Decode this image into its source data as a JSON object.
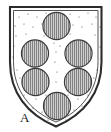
{
  "figure": {
    "name": "heraldic-shield-coat-of-arms",
    "label": "A",
    "label_position": "bottom-left",
    "background_color": "#ffffff"
  },
  "shield": {
    "outline_color": "#2b2b2b",
    "outer_stroke_width": 2.1,
    "inner_stroke_width": 0.9,
    "field_fill": "#ffffff",
    "field_texture": "stippled-dots",
    "field_dot_color": "#555555",
    "shape": "squared-top-pointed-base",
    "bounds": {
      "x": 9,
      "y": 6,
      "width": 94,
      "height": 120
    }
  },
  "charges": {
    "type": "roundel",
    "count": 6,
    "arrangement": "1-2-2-1",
    "hatching": "vertical-lines",
    "hatch_meaning": "gules",
    "fill_color": "#c9c9c9",
    "hatch_color": "#6e6e6e",
    "edge_color": "#3a3a3a",
    "items": [
      {
        "id": "roundel-1",
        "label": "1",
        "cx": 56.5,
        "cy": 26.0,
        "r": 13.6
      },
      {
        "id": "roundel-2",
        "label": "2",
        "cx": 35.0,
        "cy": 53.5,
        "r": 13.6
      },
      {
        "id": "roundel-3",
        "label": "3",
        "cx": 78.5,
        "cy": 53.5,
        "r": 13.6
      },
      {
        "id": "roundel-4",
        "label": "4",
        "cx": 35.5,
        "cy": 82.0,
        "r": 13.6
      },
      {
        "id": "roundel-5",
        "label": "5",
        "cx": 78.0,
        "cy": 82.0,
        "r": 13.6
      },
      {
        "id": "roundel-6",
        "label": "6",
        "cx": 57.0,
        "cy": 106.0,
        "r": 13.6
      }
    ]
  },
  "field_dots": [
    {
      "cx": 19,
      "cy": 17
    },
    {
      "cx": 28,
      "cy": 14
    },
    {
      "cx": 37,
      "cy": 17
    },
    {
      "cx": 46,
      "cy": 13
    },
    {
      "cx": 70,
      "cy": 14
    },
    {
      "cx": 79,
      "cy": 17
    },
    {
      "cx": 88,
      "cy": 13
    },
    {
      "cx": 96,
      "cy": 17
    },
    {
      "cx": 15,
      "cy": 26
    },
    {
      "cx": 24,
      "cy": 24
    },
    {
      "cx": 33,
      "cy": 27
    },
    {
      "cx": 42,
      "cy": 24
    },
    {
      "cx": 73,
      "cy": 25
    },
    {
      "cx": 82,
      "cy": 27
    },
    {
      "cx": 92,
      "cy": 24
    },
    {
      "cx": 100,
      "cy": 27
    },
    {
      "cx": 16,
      "cy": 36
    },
    {
      "cx": 26,
      "cy": 34
    },
    {
      "cx": 44,
      "cy": 36
    },
    {
      "cx": 54,
      "cy": 43
    },
    {
      "cx": 64,
      "cy": 36
    },
    {
      "cx": 70,
      "cy": 34
    },
    {
      "cx": 95,
      "cy": 35
    },
    {
      "cx": 102,
      "cy": 38
    },
    {
      "cx": 14,
      "cy": 46
    },
    {
      "cx": 56,
      "cy": 52
    },
    {
      "cx": 60,
      "cy": 46
    },
    {
      "cx": 100,
      "cy": 47
    },
    {
      "cx": 17,
      "cy": 70
    },
    {
      "cx": 55,
      "cy": 62
    },
    {
      "cx": 57,
      "cy": 72
    },
    {
      "cx": 97,
      "cy": 70
    },
    {
      "cx": 20,
      "cy": 78
    },
    {
      "cx": 56,
      "cy": 82
    },
    {
      "cx": 94,
      "cy": 78
    },
    {
      "cx": 24,
      "cy": 95
    },
    {
      "cx": 36,
      "cy": 99
    },
    {
      "cx": 46,
      "cy": 95
    },
    {
      "cx": 68,
      "cy": 95
    },
    {
      "cx": 78,
      "cy": 99
    },
    {
      "cx": 88,
      "cy": 95
    },
    {
      "cx": 33,
      "cy": 108
    },
    {
      "cx": 42,
      "cy": 112
    },
    {
      "cx": 74,
      "cy": 110
    },
    {
      "cx": 82,
      "cy": 106
    },
    {
      "cx": 48,
      "cy": 120
    },
    {
      "cx": 66,
      "cy": 120
    },
    {
      "cx": 30,
      "cy": 87
    },
    {
      "cx": 86,
      "cy": 87
    },
    {
      "cx": 13,
      "cy": 57
    },
    {
      "cx": 101,
      "cy": 58
    }
  ]
}
